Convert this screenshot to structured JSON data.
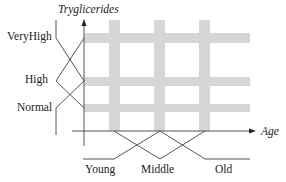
{
  "diagram": {
    "type": "fuzzy-partition-grid",
    "colors": {
      "line": "#555555",
      "band": "#d6d6d6",
      "text": "#222222"
    },
    "y_axis": {
      "title": "Tryglicerides",
      "sets": [
        {
          "label": "VeryHigh"
        },
        {
          "label": "High"
        },
        {
          "label": "Normal"
        }
      ]
    },
    "x_axis": {
      "title": "Age",
      "sets": [
        {
          "label": "Young"
        },
        {
          "label": "Middle"
        },
        {
          "label": "Old"
        }
      ]
    }
  }
}
